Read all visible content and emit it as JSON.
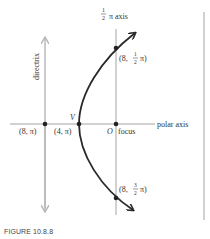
{
  "figure": {
    "caption": "FIGURE 10.8.8",
    "colors": {
      "curve": "#2a2a2a",
      "axes": "#9a9a9a",
      "directrix": "#b5b5b5",
      "text": "#333333",
      "border": "#8a8a8a"
    },
    "labels": {
      "half_pi_axis_num": "1",
      "half_pi_axis_den": "2",
      "half_pi_axis_suffix": "π axis",
      "directrix": "directrix",
      "polar_axis": "polar axis",
      "vertex": "V",
      "origin": "O",
      "focus": "focus",
      "point_directrix": "(8, π)",
      "point_vertex": "(4, π)",
      "point_top_open": "(8,",
      "point_top_num": "1",
      "point_top_den": "2",
      "point_top_close": "π)",
      "point_bottom_open": "(8,",
      "point_bottom_num": "3",
      "point_bottom_den": "2",
      "point_bottom_close": "π)"
    },
    "points": [
      {
        "name": "directrix-intersection",
        "polar": "(8, π)"
      },
      {
        "name": "vertex",
        "polar": "(4, π)"
      },
      {
        "name": "focus",
        "polar": "O"
      },
      {
        "name": "upper-point",
        "polar": "(8, ½π)"
      },
      {
        "name": "lower-point",
        "polar": "(8, 3/2 π)"
      }
    ]
  }
}
